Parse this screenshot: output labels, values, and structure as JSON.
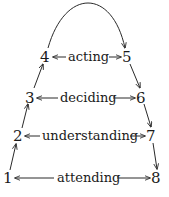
{
  "diagram": {
    "type": "stage-cycle",
    "nodes": [
      {
        "id": "1",
        "label": "1"
      },
      {
        "id": "2",
        "label": "2"
      },
      {
        "id": "3",
        "label": "3"
      },
      {
        "id": "4",
        "label": "4"
      },
      {
        "id": "5",
        "label": "5"
      },
      {
        "id": "6",
        "label": "6"
      },
      {
        "id": "7",
        "label": "7"
      },
      {
        "id": "8",
        "label": "8"
      }
    ],
    "levels": [
      {
        "left": "4",
        "right": "5",
        "label": "acting"
      },
      {
        "left": "3",
        "right": "6",
        "label": "deciding"
      },
      {
        "left": "2",
        "right": "7",
        "label": "understanding"
      },
      {
        "left": "1",
        "right": "8",
        "label": "attending"
      }
    ],
    "edges": [
      {
        "from": "1",
        "to": "2",
        "kind": "ascending"
      },
      {
        "from": "2",
        "to": "3",
        "kind": "ascending"
      },
      {
        "from": "3",
        "to": "4",
        "kind": "ascending"
      },
      {
        "from": "4",
        "to": "5",
        "kind": "arc"
      },
      {
        "from": "5",
        "to": "6",
        "kind": "descending"
      },
      {
        "from": "6",
        "to": "7",
        "kind": "descending"
      },
      {
        "from": "7",
        "to": "8",
        "kind": "descending"
      }
    ]
  }
}
